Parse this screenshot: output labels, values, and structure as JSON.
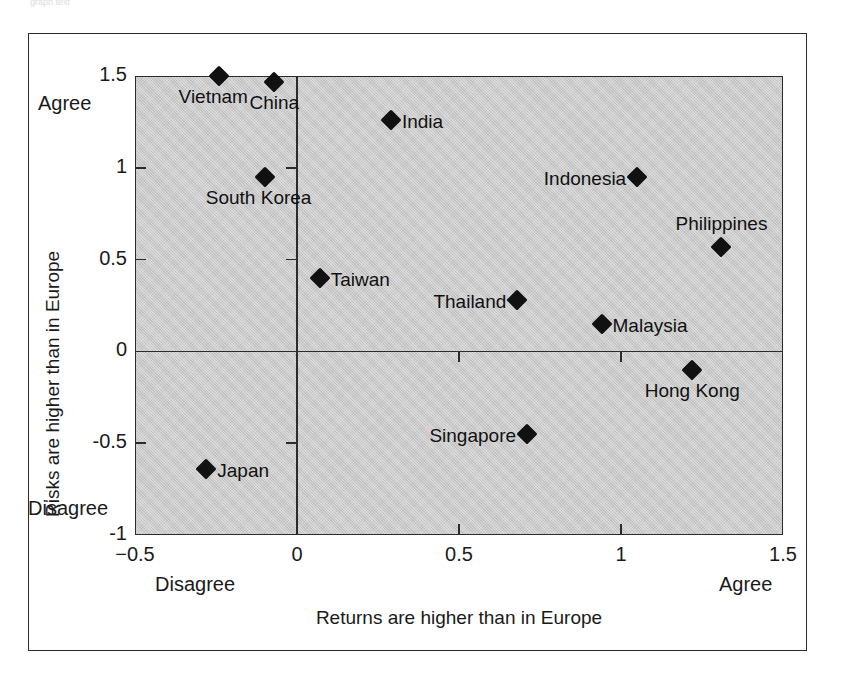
{
  "top_sliver_text": "graph text",
  "axes": {
    "y_title": "Risks are higher than in Europe",
    "x_title": "Returns are higher than in Europe",
    "y_top_anchor": "Agree",
    "y_bottom_anchor": "Disagree",
    "x_left_anchor": "Disagree",
    "x_right_anchor": "Agree"
  },
  "chart_data": {
    "type": "scatter",
    "title": "",
    "subtitle": "",
    "xlabel": "Returns are higher than in Europe",
    "ylabel": "Risks are higher than in Europe",
    "xlim": [
      -0.5,
      1.5
    ],
    "ylim": [
      -1,
      1.5
    ],
    "xticks": [
      "-0.5",
      "0",
      "0.5",
      "1",
      "1.5"
    ],
    "xtick_values": [
      -0.5,
      0,
      0.5,
      1,
      1.5
    ],
    "yticks": [
      "1.5",
      "1",
      "0.5",
      "0",
      "-0.5",
      "-1"
    ],
    "ytick_values": [
      1.5,
      1,
      0.5,
      0,
      -0.5,
      -1
    ],
    "grid": false,
    "legend": "none",
    "axis_anchor_labels": {
      "x_low": "Disagree",
      "x_high": "Agree",
      "y_low": "Disagree",
      "y_high": "Agree"
    },
    "marker": "diamond",
    "marker_color": "#111111",
    "plot_background": "#c9c9c9",
    "points": [
      {
        "label": "Vietnam",
        "x": -0.24,
        "y": 1.5,
        "label_pos": "below-left"
      },
      {
        "label": "China",
        "x": -0.07,
        "y": 1.47,
        "label_pos": "below"
      },
      {
        "label": "India",
        "x": 0.29,
        "y": 1.26,
        "label_pos": "right"
      },
      {
        "label": "South Korea",
        "x": -0.1,
        "y": 0.95,
        "label_pos": "below-left"
      },
      {
        "label": "Indonesia",
        "x": 1.05,
        "y": 0.95,
        "label_pos": "left"
      },
      {
        "label": "Philippines",
        "x": 1.31,
        "y": 0.57,
        "label_pos": "above"
      },
      {
        "label": "Taiwan",
        "x": 0.07,
        "y": 0.4,
        "label_pos": "right"
      },
      {
        "label": "Thailand",
        "x": 0.68,
        "y": 0.28,
        "label_pos": "left"
      },
      {
        "label": "Malaysia",
        "x": 0.94,
        "y": 0.15,
        "label_pos": "right"
      },
      {
        "label": "Hong Kong",
        "x": 1.22,
        "y": -0.1,
        "label_pos": "below"
      },
      {
        "label": "Singapore",
        "x": 0.71,
        "y": -0.45,
        "label_pos": "left"
      },
      {
        "label": "Japan",
        "x": -0.28,
        "y": -0.64,
        "label_pos": "right"
      }
    ]
  }
}
